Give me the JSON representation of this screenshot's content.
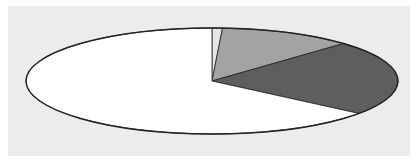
{
  "chart_data": {
    "type": "pie",
    "title": "",
    "legend": [],
    "start_angle_deg": -90,
    "direction": "clockwise",
    "slices": [
      {
        "label": "",
        "value": 0.9,
        "color": "#e6e6e6"
      },
      {
        "label": "",
        "value": 11.6,
        "color": "#a3a3a3"
      },
      {
        "label": "",
        "value": 23.0,
        "color": "#5e5e5e"
      },
      {
        "label": "",
        "value": 64.5,
        "color": "#ffffff"
      }
    ],
    "layout": {
      "background": "#ececec",
      "panel": {
        "x": 8,
        "y": 6,
        "width": 402,
        "height": 150
      },
      "ellipse": {
        "cx": 212,
        "cy": 81,
        "rx": 186,
        "ry": 53
      },
      "stroke": "#222222"
    }
  }
}
